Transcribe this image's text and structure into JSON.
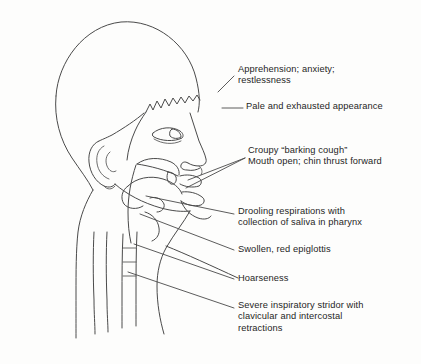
{
  "figure": {
    "line_color": "#4a4a4a",
    "text_color": "#1f1f1f",
    "background_color": "#fdfdfc"
  },
  "callouts": [
    {
      "id": "apprehension",
      "text": "Apprehension; anxiety;\nrestlessness",
      "target": "face-eye-region"
    },
    {
      "id": "pale-appearance",
      "text": "Pale and exhausted appearance",
      "target": "cheek-region"
    },
    {
      "id": "croupy-cough",
      "text": "Croupy “barking cough”\nMouth open; chin thrust forward",
      "target": "open-mouth-region"
    },
    {
      "id": "drooling",
      "text": "Drooling respirations with\ncollection of saliva in pharynx",
      "target": "pharynx-region"
    },
    {
      "id": "swollen-epiglottis",
      "text": "Swollen, red epiglottis",
      "target": "epiglottis-region"
    },
    {
      "id": "hoarseness",
      "text": "Hoarseness",
      "target": "larynx-region"
    },
    {
      "id": "inspiratory-stridor",
      "text": "Severe inspiratory stridor with\nclavicular and intercostal\nretractions",
      "target": "trachea-chest-region"
    }
  ],
  "anatomy_parts": [
    "skull-outline",
    "hairline",
    "ear",
    "eye",
    "nose",
    "upper-lip",
    "open-mouth",
    "tongue",
    "soft-palate",
    "uvula",
    "epiglottis",
    "pharynx",
    "larynx",
    "trachea",
    "cervical-spine",
    "neck-contour",
    "chin",
    "jaw",
    "shoulder"
  ]
}
